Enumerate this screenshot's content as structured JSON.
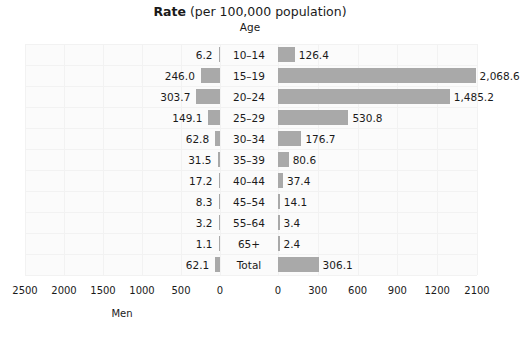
{
  "header": {
    "title_strong": "Rate",
    "title_rest": " (per 100,000 population)",
    "subtitle": "Age"
  },
  "chart_data": {
    "type": "bar",
    "orientation": "horizontal-diverging",
    "title": "Rate (per 100,000 population)",
    "subtitle": "Age",
    "categories": [
      "10–14",
      "15–19",
      "20–24",
      "25–29",
      "30–34",
      "35–39",
      "40–44",
      "45–54",
      "55–64",
      "65+",
      "Total"
    ],
    "series": [
      {
        "name": "Men",
        "side": "left",
        "values": [
          6.2,
          246.0,
          303.7,
          149.1,
          62.8,
          31.5,
          17.2,
          8.3,
          3.2,
          1.1,
          62.1
        ],
        "labels": [
          "6.2",
          "246.0",
          "303.7",
          "149.1",
          "62.8",
          "31.5",
          "17.2",
          "8.3",
          "3.2",
          "1.1",
          "62.1"
        ],
        "axis_label": "Men",
        "ticks": [
          2500,
          2000,
          1500,
          1000,
          500,
          0
        ],
        "tick_labels": [
          "2500",
          "2000",
          "1500",
          "1000",
          "500",
          "0"
        ],
        "axis_max": 2500
      },
      {
        "name": "Women",
        "side": "right",
        "values": [
          126.4,
          2068.6,
          1485.2,
          530.8,
          176.7,
          80.6,
          37.4,
          14.1,
          3.4,
          2.4,
          306.1
        ],
        "labels": [
          "126.4",
          "2,068.6",
          "1,485.2",
          "530.8",
          "176.7",
          "80.6",
          "37.4",
          "14.1",
          "3.4",
          "2.4",
          "306.1"
        ],
        "axis_label": "",
        "ticks": [
          0,
          300,
          600,
          900,
          1200,
          2100
        ],
        "tick_labels": [
          "0",
          "300",
          "600",
          "900",
          "1200",
          "2100"
        ],
        "axis_max": 2100
      }
    ],
    "grid": true,
    "bar_color": "#a9a9a9",
    "panel_color": "#fbfbfb",
    "gridline_color": "#f2f2f2"
  }
}
